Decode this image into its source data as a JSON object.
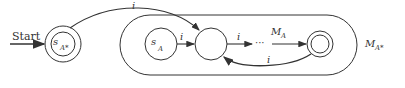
{
  "diagram": {
    "start_label": "Start",
    "start_state": {
      "name": "s",
      "sub": "A*"
    },
    "machine_state": {
      "name": "s",
      "sub": "A"
    },
    "edges": {
      "start_to_middle": "i",
      "sa_to_middle": "i",
      "middle_to_dots": "i",
      "final_back": "i"
    },
    "inner_machine": {
      "name": "M",
      "sub": "A"
    },
    "outer_machine": {
      "name": "M",
      "sub": "A*"
    },
    "colors": {
      "stroke": "#333333",
      "background": "#ffffff"
    }
  }
}
